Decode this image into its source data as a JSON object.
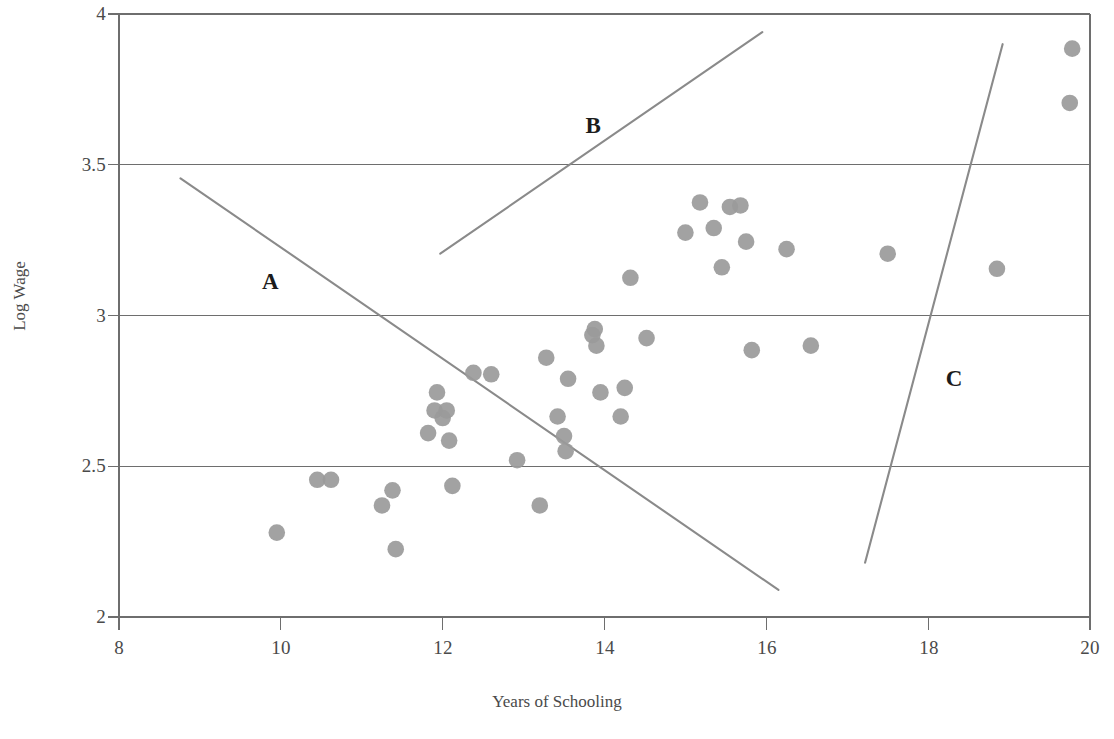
{
  "chart_data": {
    "type": "scatter",
    "title": "",
    "xlabel": "Years of Schooling",
    "ylabel": "Log Wage",
    "xlim": [
      8,
      20
    ],
    "ylim": [
      2,
      4
    ],
    "xticks": [
      "8",
      "10",
      "12",
      "14",
      "16",
      "18",
      "20"
    ],
    "yticks": [
      "2",
      "2.5",
      "3",
      "3.5",
      "4"
    ],
    "grid": "horizontal",
    "legend": "none",
    "marker_color": "#9a9a9a",
    "line_color": "#8a8a8a",
    "axis_color": "#6e6e6e",
    "points": [
      {
        "x": 9.95,
        "y": 2.28
      },
      {
        "x": 10.45,
        "y": 2.455
      },
      {
        "x": 10.62,
        "y": 2.455
      },
      {
        "x": 11.25,
        "y": 2.37
      },
      {
        "x": 11.38,
        "y": 2.42
      },
      {
        "x": 11.42,
        "y": 2.225
      },
      {
        "x": 11.82,
        "y": 2.61
      },
      {
        "x": 11.9,
        "y": 2.685
      },
      {
        "x": 11.93,
        "y": 2.745
      },
      {
        "x": 12.0,
        "y": 2.66
      },
      {
        "x": 12.05,
        "y": 2.685
      },
      {
        "x": 12.08,
        "y": 2.585
      },
      {
        "x": 12.12,
        "y": 2.435
      },
      {
        "x": 12.38,
        "y": 2.81
      },
      {
        "x": 12.6,
        "y": 2.805
      },
      {
        "x": 12.92,
        "y": 2.52
      },
      {
        "x": 13.2,
        "y": 2.37
      },
      {
        "x": 13.28,
        "y": 2.86
      },
      {
        "x": 13.42,
        "y": 2.665
      },
      {
        "x": 13.5,
        "y": 2.6
      },
      {
        "x": 13.52,
        "y": 2.55
      },
      {
        "x": 13.55,
        "y": 2.79
      },
      {
        "x": 13.85,
        "y": 2.935
      },
      {
        "x": 13.88,
        "y": 2.955
      },
      {
        "x": 13.9,
        "y": 2.9
      },
      {
        "x": 13.95,
        "y": 2.745
      },
      {
        "x": 14.2,
        "y": 2.665
      },
      {
        "x": 14.25,
        "y": 2.76
      },
      {
        "x": 14.32,
        "y": 3.125
      },
      {
        "x": 14.52,
        "y": 2.925
      },
      {
        "x": 15.0,
        "y": 3.275
      },
      {
        "x": 15.18,
        "y": 3.375
      },
      {
        "x": 15.35,
        "y": 3.29
      },
      {
        "x": 15.45,
        "y": 3.16
      },
      {
        "x": 15.55,
        "y": 3.36
      },
      {
        "x": 15.68,
        "y": 3.365
      },
      {
        "x": 15.75,
        "y": 3.245
      },
      {
        "x": 15.82,
        "y": 2.885
      },
      {
        "x": 16.25,
        "y": 3.22
      },
      {
        "x": 16.55,
        "y": 2.9
      },
      {
        "x": 17.5,
        "y": 3.205
      },
      {
        "x": 18.85,
        "y": 3.155
      },
      {
        "x": 19.78,
        "y": 3.885
      },
      {
        "x": 19.75,
        "y": 3.705
      }
    ],
    "annotation_lines": [
      {
        "label": "A",
        "x1": 8.76,
        "y1": 3.455,
        "x2": 16.15,
        "y2": 2.09,
        "label_x": 9.87,
        "label_y": 3.11
      },
      {
        "label": "B",
        "x1": 11.97,
        "y1": 3.205,
        "x2": 15.95,
        "y2": 3.94,
        "label_x": 13.86,
        "label_y": 3.63
      },
      {
        "label": "C",
        "x1": 17.22,
        "y1": 2.18,
        "x2": 18.92,
        "y2": 3.9,
        "label_x": 18.32,
        "label_y": 2.79
      }
    ]
  },
  "caption": {
    "text": ""
  }
}
